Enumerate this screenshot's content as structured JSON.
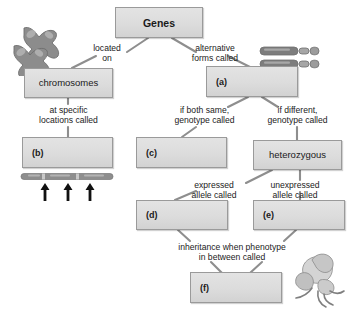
{
  "diagram": {
    "colors": {
      "box_fill": "#dcdcdc",
      "box_border": "#9a9a9a",
      "line": "#8e8e8e",
      "text": "#1a1a1a",
      "chromosome_dark": "#7a7a7a",
      "chromosome_light": "#a9a9a9",
      "arrow": "#141414",
      "flower": "#cfcfcf"
    },
    "boxes": [
      {
        "id": "genes",
        "label": "Genes"
      },
      {
        "id": "chromosomes",
        "label": "chromosomes"
      },
      {
        "id": "a",
        "label": "(a)"
      },
      {
        "id": "b",
        "label": "(b)"
      },
      {
        "id": "c",
        "label": "(c)"
      },
      {
        "id": "heterozygous",
        "label": "heterozygous"
      },
      {
        "id": "d",
        "label": "(d)"
      },
      {
        "id": "e",
        "label": "(e)"
      },
      {
        "id": "f",
        "label": "(f)"
      }
    ],
    "connector_labels": [
      {
        "id": "located-on",
        "text": "located\non"
      },
      {
        "id": "alternative-forms",
        "text": "alternative\nforms called"
      },
      {
        "id": "at-specific-locations",
        "text": "at specific\nlocations called"
      },
      {
        "id": "if-both-same",
        "text": "if both same,\ngenotype called"
      },
      {
        "id": "if-different",
        "text": "if different,\ngenotype called"
      },
      {
        "id": "expressed-allele",
        "text": "expressed\nallele called"
      },
      {
        "id": "unexpressed-allele",
        "text": "unexpressed\nallele called"
      },
      {
        "id": "inheritance-phenotype",
        "text": "inheritance when phenotype\nin between called"
      }
    ],
    "artwork": [
      {
        "id": "chromosome-pair-x",
        "description": "two X-shaped chromosomes"
      },
      {
        "id": "chromosome-pair-rods",
        "description": "two rod chromosomes with centromere"
      },
      {
        "id": "chromosome-bar-arrows",
        "description": "chromosome bar with three locus arrows"
      },
      {
        "id": "flower",
        "description": "flower illustration"
      }
    ]
  }
}
